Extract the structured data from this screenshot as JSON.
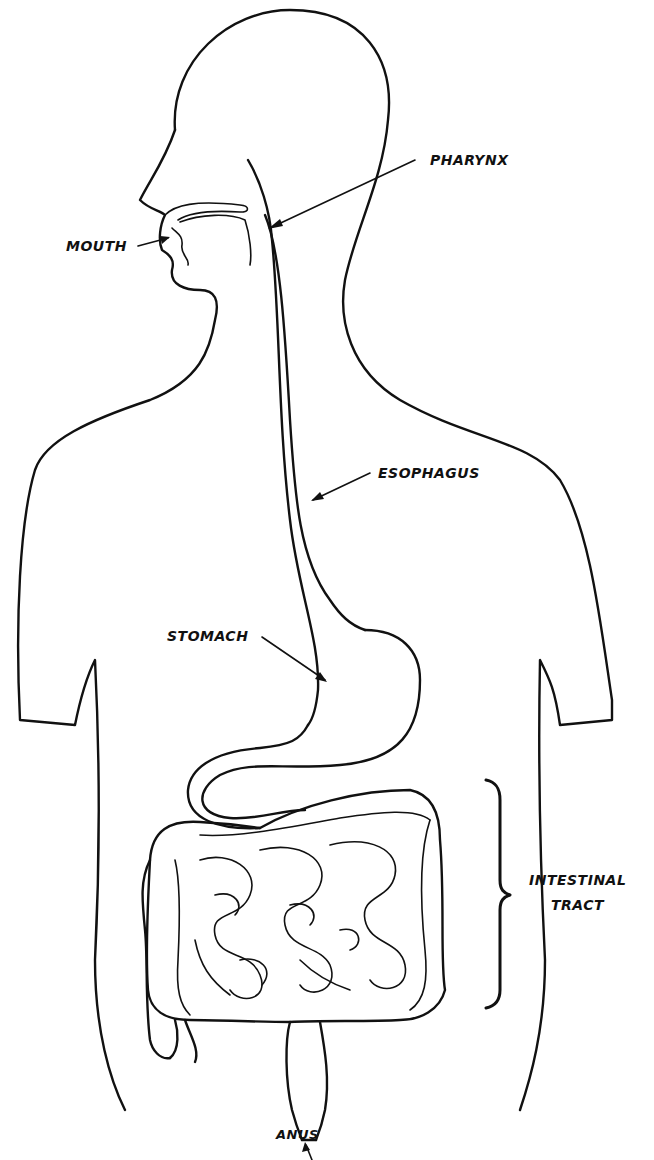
{
  "diagram": {
    "type": "anatomical-line-drawing",
    "labels": {
      "pharynx": "PHARYNX",
      "mouth": "MOUTH",
      "esophagus": "ESOPHAGUS",
      "stomach": "STOMACH",
      "intestinal_tract_line1": "INTESTINAL",
      "intestinal_tract_line2": "TRACT",
      "anus": "ANUS"
    },
    "caption_partial": "(caption text cut off at bottom edge)"
  },
  "colors": {
    "line": "#111111",
    "background": "#ffffff"
  }
}
